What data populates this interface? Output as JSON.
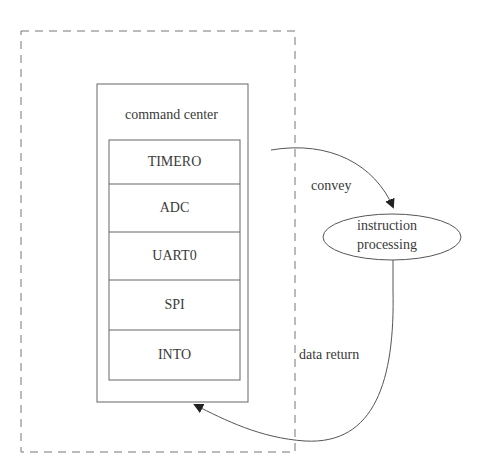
{
  "diagram": {
    "container_label": "command center",
    "modules": [
      "TIMERO",
      "ADC",
      "UART0",
      "SPI",
      "INTO"
    ],
    "process_node": {
      "line1": "instruction",
      "line2": "processing"
    },
    "edges": {
      "forward_label": "convey",
      "return_label": "data return"
    },
    "colors": {
      "stroke": "#666666",
      "text": "#3a3a3a",
      "background": "#ffffff"
    }
  }
}
